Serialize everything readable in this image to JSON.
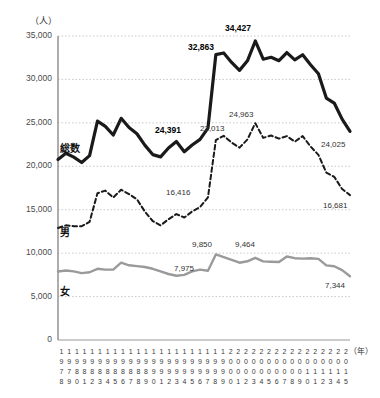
{
  "chart_data": {
    "type": "line",
    "title": "",
    "unit_label": "（人）",
    "xlabel": "（年）",
    "ylabel": "",
    "ylim": [
      0,
      35000
    ],
    "ytick_values": [
      0,
      5000,
      10000,
      15000,
      20000,
      25000,
      30000,
      35000
    ],
    "ytick_labels": [
      "0",
      "5,000",
      "10,000",
      "15,000",
      "20,000",
      "25,000",
      "30,000",
      "35,000"
    ],
    "grid": true,
    "legend_position": "inline",
    "categories": [
      "1978",
      "1979",
      "1980",
      "1981",
      "1982",
      "1983",
      "1984",
      "1985",
      "1986",
      "1987",
      "1988",
      "1989",
      "1990",
      "1991",
      "1992",
      "1993",
      "1994",
      "1995",
      "1996",
      "1997",
      "1998",
      "1999",
      "2000",
      "2001",
      "2002",
      "2003",
      "2004",
      "2005",
      "2006",
      "2007",
      "2008",
      "2009",
      "2010",
      "2011",
      "2012",
      "2013",
      "2014",
      "2015"
    ],
    "series": [
      {
        "name": "総数",
        "style": "solid-bold",
        "color": "#1a1a1a",
        "values": [
          20788,
          21503,
          21048,
          20434,
          21228,
          25202,
          24596,
          23599,
          25524,
          24460,
          23742,
          22436,
          21346,
          21084,
          22104,
          22848,
          21679,
          22445,
          23104,
          24391,
          32863,
          33048,
          31957,
          31042,
          32143,
          34427,
          32325,
          32552,
          32155,
          33093,
          32249,
          32845,
          31690,
          30651,
          27858,
          27283,
          25427,
          24025
        ]
      },
      {
        "name": "男",
        "style": "dashed",
        "color": "#1a1a1a",
        "values": [
          12900,
          13200,
          13100,
          13100,
          13600,
          16900,
          17200,
          16400,
          17300,
          16800,
          16200,
          14800,
          13700,
          13200,
          13900,
          14500,
          14100,
          14800,
          15300,
          16416,
          23013,
          23512,
          22727,
          22144,
          23080,
          24963,
          23272,
          23540,
          23181,
          23478,
          22831,
          23472,
          22283,
          21307,
          19273,
          18787,
          17386,
          16681
        ]
      },
      {
        "name": "女",
        "style": "solid-gray",
        "color": "#9a9a9a",
        "values": [
          7888,
          8000,
          7900,
          7700,
          7800,
          8200,
          8100,
          8100,
          8900,
          8600,
          8500,
          8400,
          8200,
          7900,
          7600,
          7400,
          7500,
          7900,
          8100,
          7975,
          9850,
          9536,
          9230,
          8898,
          9063,
          9464,
          9053,
          9012,
          8974,
          9615,
          9418,
          9373,
          9407,
          9344,
          8585,
          8496,
          8041,
          7344
        ]
      }
    ],
    "annotations": [
      {
        "label": "24,391",
        "series": "総数",
        "year": "1997",
        "bold": true,
        "x": 155,
        "y": 125
      },
      {
        "label": "32,863",
        "series": "総数",
        "year": "1998",
        "bold": true,
        "x": 188,
        "y": 42
      },
      {
        "label": "34,427",
        "series": "総数",
        "year": "2003",
        "bold": true,
        "x": 225,
        "y": 23
      },
      {
        "label": "24,025",
        "series": "総数",
        "year": "2015",
        "bold": false,
        "x": 321,
        "y": 140
      },
      {
        "label": "16,416",
        "series": "男",
        "year": "1997",
        "bold": false,
        "x": 166,
        "y": 188
      },
      {
        "label": "23,013",
        "series": "男",
        "year": "1998",
        "bold": false,
        "x": 200,
        "y": 124
      },
      {
        "label": "24,963",
        "series": "男",
        "year": "2003",
        "bold": false,
        "x": 229,
        "y": 110
      },
      {
        "label": "16,681",
        "series": "男",
        "year": "2015",
        "bold": false,
        "x": 323,
        "y": 201
      },
      {
        "label": "7,975",
        "series": "女",
        "year": "1997",
        "bold": false,
        "x": 174,
        "y": 264
      },
      {
        "label": "9,850",
        "series": "女",
        "year": "1998",
        "bold": false,
        "x": 192,
        "y": 240
      },
      {
        "label": "9,464",
        "series": "女",
        "year": "2003",
        "bold": false,
        "x": 235,
        "y": 240
      },
      {
        "label": "7,344",
        "series": "女",
        "year": "2015",
        "bold": false,
        "x": 325,
        "y": 281
      }
    ],
    "series_labels": [
      {
        "text": "総数",
        "x": 60,
        "y": 140
      },
      {
        "text": "男",
        "x": 60,
        "y": 224
      },
      {
        "text": "女",
        "x": 60,
        "y": 283
      }
    ]
  }
}
